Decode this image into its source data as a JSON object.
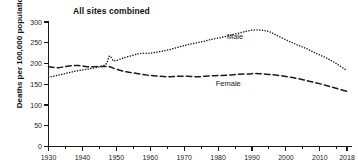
{
  "chart_data": {
    "type": "line",
    "title": "All sites combined",
    "xlabel": "",
    "ylabel": "Deaths per 100,000 population",
    "xlim": [
      1930,
      2018
    ],
    "ylim": [
      0,
      300
    ],
    "ytick_values": [
      0,
      50,
      100,
      150,
      200,
      250,
      300
    ],
    "ytick_labels": [
      "0",
      "50",
      "100",
      "150",
      "200",
      "250",
      "300"
    ],
    "xtick_values": [
      1930,
      1940,
      1950,
      1960,
      1970,
      1980,
      1990,
      2000,
      2010,
      2018
    ],
    "xtick_labels": [
      "1930",
      "1940",
      "1950",
      "1960",
      "1970",
      "1980",
      "1990",
      "2000",
      "2010",
      "2018"
    ],
    "xtick_minor_values": [
      1935,
      1945,
      1955,
      1965,
      1975,
      1985,
      1995,
      2005,
      2015
    ],
    "grid": false,
    "legend": "inline-annotations",
    "annotations": [
      {
        "text": "Male",
        "x": 1985,
        "y": 258
      },
      {
        "text": "Female",
        "x": 1983,
        "y": 146
      }
    ],
    "series": [
      {
        "name": "Male",
        "line_style": "dotted",
        "color": "#1a1a1a",
        "x": [
          1930,
          1933,
          1936,
          1939,
          1942,
          1945,
          1947,
          1948,
          1949,
          1950,
          1952,
          1955,
          1957,
          1960,
          1963,
          1966,
          1969,
          1972,
          1975,
          1978,
          1981,
          1984,
          1987,
          1989,
          1991,
          1993,
          1995,
          1997,
          2000,
          2003,
          2006,
          2009,
          2012,
          2015,
          2018
        ],
        "y": [
          167,
          172,
          178,
          183,
          187,
          192,
          199,
          218,
          208,
          207,
          213,
          220,
          224,
          225,
          229,
          234,
          241,
          247,
          252,
          258,
          263,
          269,
          275,
          279,
          281,
          280,
          277,
          269,
          257,
          246,
          236,
          224,
          213,
          199,
          183
        ]
      },
      {
        "name": "Female",
        "line_style": "dashed",
        "color": "#1a1a1a",
        "x": [
          1930,
          1933,
          1936,
          1939,
          1942,
          1945,
          1948,
          1950,
          1953,
          1956,
          1959,
          1962,
          1965,
          1968,
          1971,
          1974,
          1977,
          1980,
          1983,
          1986,
          1989,
          1991,
          1993,
          1996,
          1999,
          2002,
          2005,
          2008,
          2011,
          2014,
          2018
        ],
        "y": [
          192,
          190,
          194,
          195,
          192,
          193,
          192,
          186,
          180,
          176,
          172,
          170,
          168,
          169,
          169,
          168,
          170,
          171,
          172,
          174,
          175,
          176,
          175,
          173,
          170,
          166,
          161,
          155,
          149,
          142,
          133
        ]
      }
    ]
  }
}
